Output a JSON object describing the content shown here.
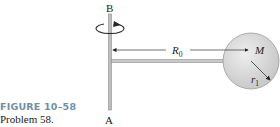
{
  "figure": {
    "caption_title": "FIGURE 10–58",
    "caption_subtitle": "Problem 58.",
    "labels": {
      "top_end": "B",
      "bottom_end": "A",
      "distance": "R",
      "distance_sub": "0",
      "mass": "M",
      "radius": "r",
      "radius_sub": "1"
    },
    "colors": {
      "rod": "#b9b9b9",
      "sphere_fill": "#d6d6d6",
      "sphere_edge": "#9a9a9a",
      "line": "#333333",
      "caption_title": "#6f8fa8"
    }
  }
}
